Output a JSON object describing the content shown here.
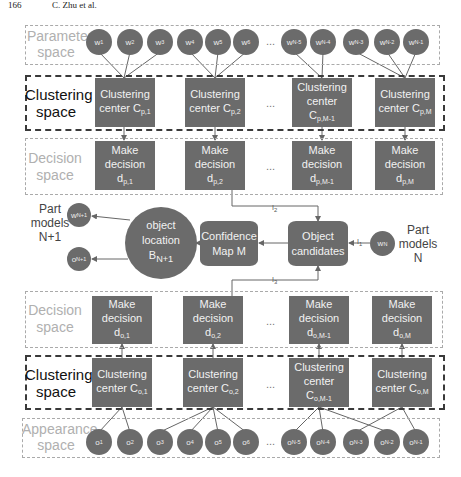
{
  "header": {
    "page": "166",
    "authors": "C. Zhu et al."
  },
  "regions": {
    "parameter_space": "Parameter space",
    "clustering_space_top": "Clustering space",
    "decision_space_top": "Decision space",
    "decision_space_bottom": "Decision space",
    "clustering_space_bottom": "Clustering space",
    "appearance_space": "Appearance space"
  },
  "parameter_nodes": [
    {
      "base": "w",
      "sub": "1"
    },
    {
      "base": "w",
      "sub": "2"
    },
    {
      "base": "w",
      "sub": "3"
    },
    {
      "base": "w",
      "sub": "4"
    },
    {
      "base": "w",
      "sub": "5"
    },
    {
      "base": "w",
      "sub": "6"
    },
    {
      "base": "w",
      "sub": "N-5"
    },
    {
      "base": "w",
      "sub": "N-4"
    },
    {
      "base": "w",
      "sub": "N-3"
    },
    {
      "base": "w",
      "sub": "N-2"
    },
    {
      "base": "w",
      "sub": "N-1"
    }
  ],
  "clustering_top": [
    {
      "line1": "Clustering",
      "line2": "center C",
      "sub": "p,1"
    },
    {
      "line1": "Clustering",
      "line2": "center C",
      "sub": "p,2"
    },
    {
      "line1": "Clustering",
      "line2": "center",
      "line3": "C",
      "sub": "p,M-1"
    },
    {
      "line1": "Clustering",
      "line2": "center C",
      "sub": "p,M"
    }
  ],
  "decision_top": [
    {
      "line1": "Make",
      "line2": "decision",
      "base": "d",
      "sub": "p,1"
    },
    {
      "line1": "Make",
      "line2": "decision",
      "base": "d",
      "sub": "p,2"
    },
    {
      "line1": "Make",
      "line2": "decision",
      "base": "d",
      "sub": "p,M-1"
    },
    {
      "line1": "Make",
      "line2": "decision",
      "base": "d",
      "sub": "p,M"
    }
  ],
  "middle": {
    "part_models_left": "Part models N+1",
    "part_models_left_lines": [
      "Part",
      "models",
      "N+1"
    ],
    "w_next": {
      "base": "w",
      "sub": "N+1"
    },
    "o_next": {
      "base": "o",
      "sub": "N+1"
    },
    "object_location": {
      "line1": "object",
      "line2": "location",
      "base": "B",
      "sub": "N+1"
    },
    "confidence_map": {
      "line1": "Confidence",
      "line2": "Map M"
    },
    "object_candidates": {
      "line1": "Object",
      "line2": "candidates"
    },
    "w_n": {
      "base": "w",
      "sub": "N"
    },
    "part_models_right_lines": [
      "Part",
      "models",
      "N"
    ],
    "edge_labels": {
      "top": {
        "base": "I",
        "sub": "2"
      },
      "right": {
        "base": "I",
        "sub": "1"
      },
      "bottom": {
        "base": "I",
        "sub": "3"
      }
    }
  },
  "decision_bottom": [
    {
      "line1": "Make",
      "line2": "decision",
      "base": "d",
      "sub": "o,1"
    },
    {
      "line1": "Make",
      "line2": "decision",
      "base": "d",
      "sub": "o,2"
    },
    {
      "line1": "Make",
      "line2": "decision",
      "base": "d",
      "sub": "o,M-1"
    },
    {
      "line1": "Make",
      "line2": "decision",
      "base": "d",
      "sub": "o,M"
    }
  ],
  "clustering_bottom": [
    {
      "line1": "Clustering",
      "line2": "center C",
      "sub": "o,1"
    },
    {
      "line1": "Clustering",
      "line2": "center C",
      "sub": "o,2"
    },
    {
      "line1": "Clustering",
      "line2": "center",
      "line3": "C",
      "sub": "o,M-1"
    },
    {
      "line1": "Clustering",
      "line2": "center C",
      "sub": "o,M"
    }
  ],
  "appearance_nodes": [
    {
      "base": "o",
      "sub": "1"
    },
    {
      "base": "o",
      "sub": "2"
    },
    {
      "base": "o",
      "sub": "3"
    },
    {
      "base": "o",
      "sub": "4"
    },
    {
      "base": "o",
      "sub": "5"
    },
    {
      "base": "o",
      "sub": "6"
    },
    {
      "base": "o",
      "sub": "N-5"
    },
    {
      "base": "o",
      "sub": "N-4"
    },
    {
      "base": "o",
      "sub": "N-3"
    },
    {
      "base": "o",
      "sub": "N-2"
    },
    {
      "base": "o",
      "sub": "N-1"
    }
  ],
  "ellipsis": "..."
}
